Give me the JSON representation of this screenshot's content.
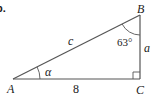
{
  "problem": {
    "number_label": "b."
  },
  "triangle": {
    "vertices": {
      "A": {
        "label": "A",
        "x": 13,
        "y": 79
      },
      "B": {
        "label": "B",
        "x": 140,
        "y": 15
      },
      "C": {
        "label": "C",
        "x": 140,
        "y": 79
      }
    },
    "sides": {
      "hypotenuse": {
        "label": "c",
        "from": "A",
        "to": "B"
      },
      "base": {
        "label": "8",
        "from": "A",
        "to": "C"
      },
      "vertical": {
        "label": "a",
        "from": "C",
        "to": "B"
      }
    },
    "angles": {
      "at_A": {
        "label": "α"
      },
      "at_B": {
        "label": "63°"
      },
      "at_C": {
        "label": "right-angle",
        "marker": "square"
      }
    },
    "stroke_color": "#555555",
    "text_color": "#222222"
  }
}
